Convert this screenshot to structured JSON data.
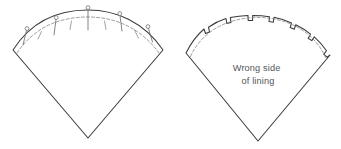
{
  "diagram": {
    "background_color": "#ffffff",
    "outline_color": "#3a3a3c",
    "seamline_color": "#8a8a8f",
    "pin_color": "#6e6e73",
    "text_color": "#55555a",
    "figures": [
      {
        "name": "pinned-collar-figure",
        "position": "left",
        "description": "Fan shaped collar piece with pins along the curved upper edge",
        "apex": {
          "x": 88,
          "y": 138
        },
        "left_corner": {
          "x": 13,
          "y": 50
        },
        "right_corner": {
          "x": 163,
          "y": 50
        },
        "arc_top": {
          "x": 88,
          "y": 14
        },
        "has_dashed_seamline": true,
        "pins": [
          {
            "index": 1,
            "head_x": 26,
            "head_y": 29
          },
          {
            "index": 2,
            "head_x": 56,
            "head_y": 18
          },
          {
            "index": 3,
            "head_x": 88,
            "head_y": 8
          },
          {
            "index": 4,
            "head_x": 120,
            "head_y": 14
          },
          {
            "index": 5,
            "head_x": 148,
            "head_y": 27
          }
        ],
        "pin_count": 5,
        "tick_marks": 4,
        "labels": []
      },
      {
        "name": "clipped-lining-figure",
        "position": "right",
        "description": "Fan shaped lining piece with clipped notches along the curved upper edge",
        "apex": {
          "x": 258,
          "y": 141
        },
        "left_corner": {
          "x": 186,
          "y": 53
        },
        "right_corner": {
          "x": 330,
          "y": 55
        },
        "arc_top": {
          "x": 258,
          "y": 16
        },
        "has_dashed_seamline": true,
        "notch_count": 8,
        "labels": [
          {
            "name": "wrong-side-label",
            "line1": "Wrong side",
            "line2": "of lining",
            "x": 258,
            "y": 72
          }
        ]
      }
    ]
  },
  "annotations": {
    "wrong_side_line1": "Wrong side",
    "wrong_side_line2": "of lining"
  }
}
